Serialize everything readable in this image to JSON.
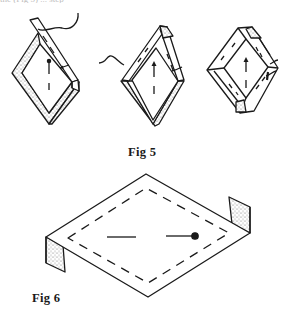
{
  "page": {
    "top_cut_text": "the (Fig 5) ... step",
    "colors": {
      "ink": "#1a1a1a",
      "paper": "#ffffff",
      "stipple": "#9a9a9a"
    }
  },
  "figures": [
    {
      "id": "fig5",
      "caption": "Fig 5",
      "panels": [
        {
          "name": "step-1",
          "description": "Diamond frame with one folded strip, stippled underside, thread and arrow"
        },
        {
          "name": "step-2",
          "description": "Diamond frame with two folded strips, thread on left, arrow"
        },
        {
          "name": "step-3",
          "description": "Fully folded diamond frame with stippled corner tabs"
        }
      ]
    },
    {
      "id": "fig6",
      "caption": "Fig 6",
      "description": "Flat rhombus sheet with dashed inner outline, stippled side tabs, a line and a line ending in a dot"
    }
  ]
}
